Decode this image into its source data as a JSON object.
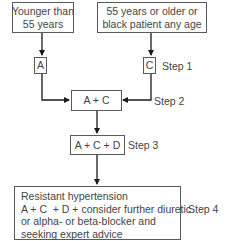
{
  "diagram": {
    "type": "flowchart",
    "start_boxes": [
      {
        "id": "young",
        "lines": [
          "Younger than",
          "55 years"
        ]
      },
      {
        "id": "old",
        "lines": [
          "55 years or older or",
          "black patient any age"
        ]
      }
    ],
    "nodes": {
      "a": "A",
      "c": "C",
      "ac": "A + C",
      "acd": "A + C + D",
      "resistant": {
        "lines": [
          "Resistant hypertension",
          "A + C  + D + consider further diuretic",
          "or alpha- or beta-blocker and",
          "seeking expert advice"
        ]
      }
    },
    "steps": {
      "step1": "Step 1",
      "step2": "Step 2",
      "step3": "Step 3",
      "step4": "Step 4"
    },
    "colors": {
      "line": "#1a1a1a",
      "border": "#5a5a5a",
      "text": "#444444"
    }
  }
}
